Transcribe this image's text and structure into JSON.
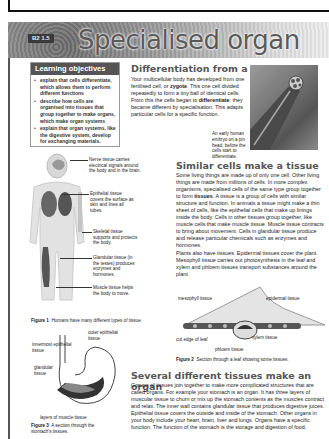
{
  "header": {
    "badge": "B2 1.5",
    "title": "Specialised organ systems"
  },
  "learning_objectives": {
    "heading": "Learning objectives",
    "items": [
      "explain that cells differentiate, which allows them to perform different functions",
      "describe how cells are organised into tissues that group together to make organs, which make organ systems",
      "explain that organ systems, like the digestive system, develop for exchanging materials."
    ]
  },
  "section1": {
    "heading": "Differentiation from a single cell",
    "text_parts": [
      "Your multicellular body has developed from one fertilised cell, or ",
      "zygote",
      ". This one cell divided repeatedly to form a tiny ball of identical cells. From this the cells began to ",
      "differentiate",
      ": they became different by specialisation. This adapts particular cells for a specific function."
    ],
    "photo_caption": "An early human embryo on a pin head, before the cells start to differentiate."
  },
  "figure1": {
    "labels": {
      "nerve": "Nerve tissue carries electrical signals around the body and in the brain.",
      "epithelial": "Epithelial tissue covers the surface as skin and lines all tubes.",
      "skeletal": "Skeletal tissue supports and protects the body.",
      "glandular": "Glandular tissue (in the testes) produces enzymes and hormones.",
      "muscle": "Muscle tissue helps the body to move."
    },
    "caption_label": "Figure 1",
    "caption_text": "Humans have many different types of tissue."
  },
  "section2": {
    "heading": "Similar cells make a tissue",
    "para1_parts": [
      "Some living things are made up of only one cell. Other living things are made from millions of cells. In more complex organisms, specialised cells of the same type group together to form ",
      "tissues",
      ". A tissue is a group of cells with similar structure and function. In animals a tissue might make a thin sheet of cells, like the epithelial cells that make up linings inside the body. Cells in other tissues group together, like muscle cells that make muscle tissue. Muscle tissue contracts to bring about movement. Cells in glandular tissue produce and release particular chemicals such as enzymes and hormones."
    ],
    "para2": "Plants also have tissues. Epidermal tissues cover the plant. Mesophyll tissue carries out photosynthesis in the leaf and xylem and phloem tissues transport substances around the plant."
  },
  "figure2": {
    "labels": {
      "mesophyll": "mesophyll tissue",
      "epidermal": "epidermal tissue",
      "cut_edge": "cut edge of leaf",
      "xylem": "xylem tissue",
      "phloem": "phloem tissue"
    },
    "caption_label": "Figure 2",
    "caption_text": "Section through a leaf showing some tissues."
  },
  "figure3": {
    "labels": {
      "outer": "outer epithelial tissue",
      "innermost": "innermost epithelial tissue",
      "glandular": "glandular tissue",
      "muscle_layers": "layers of muscle tissue"
    },
    "caption_label": "Figure 3",
    "caption_text": "A section through the stomach's tissues."
  },
  "section3": {
    "heading": "Several different tissues make an organ",
    "text": "Groups of tissues join together to make more complicated structures that are called organs. For example your stomach is an organ. It has three layers of muscular tissue to churn or mix up the stomach contents as the muscles contract and relax. The inner wall contains glandular tissue that produces digestive juices. Epithelial tissue covers the outside and inside of the stomach. Other organs in your body include your heart, brain, liver and lungs. Organs have a specific function. The function of the stomach is the storage and digestion of food."
  }
}
